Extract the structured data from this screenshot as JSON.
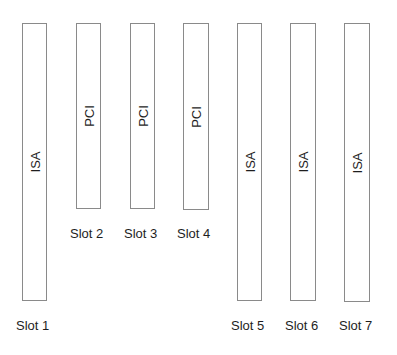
{
  "diagram": {
    "slots": [
      {
        "name": "Slot 1",
        "bus": "ISA"
      },
      {
        "name": "Slot 2",
        "bus": "PCI"
      },
      {
        "name": "Slot 3",
        "bus": "PCI"
      },
      {
        "name": "Slot 4",
        "bus": "PCI"
      },
      {
        "name": "Slot 5",
        "bus": "ISA"
      },
      {
        "name": "Slot 6",
        "bus": "ISA"
      },
      {
        "name": "Slot 7",
        "bus": "ISA"
      }
    ]
  }
}
